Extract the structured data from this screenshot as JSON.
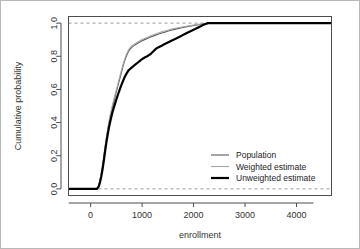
{
  "chart_data": {
    "type": "line",
    "title": "",
    "xlabel": "enrollment",
    "ylabel": "Cumulative probability",
    "xlim": [
      -430,
      4680
    ],
    "ylim": [
      -0.04,
      1.04
    ],
    "xticks": [
      0,
      1000,
      2000,
      3000,
      4000
    ],
    "xtick_labels": [
      "0",
      "1000",
      "2000",
      "3000",
      "4000"
    ],
    "yticks": [
      0.0,
      0.2,
      0.4,
      0.6,
      0.8,
      1.0
    ],
    "ytick_labels": [
      "0.0",
      "0.2",
      "0.4",
      "0.6",
      "0.8",
      "1.0"
    ],
    "grid": false,
    "reference_lines": [
      {
        "orientation": "horizontal",
        "value": 0.0,
        "style": "dashed",
        "color": "#999999"
      },
      {
        "orientation": "horizontal",
        "value": 1.0,
        "style": "dashed",
        "color": "#999999"
      }
    ],
    "legend": {
      "position": "lower-right",
      "entries": [
        {
          "label": "Population",
          "color": "#5a5a5a",
          "width": 1.1
        },
        {
          "label": "Weighted estimate",
          "color": "#a6a6a6",
          "width": 1.1
        },
        {
          "label": "Unweighted estimate",
          "color": "#000000",
          "width": 2.2
        }
      ]
    },
    "series": [
      {
        "name": "Population",
        "color": "#5a5a5a",
        "width": 1.1,
        "points": [
          [
            -430,
            0.0
          ],
          [
            60,
            0.0
          ],
          [
            120,
            0.0
          ],
          [
            150,
            0.015
          ],
          [
            175,
            0.04
          ],
          [
            200,
            0.075
          ],
          [
            225,
            0.12
          ],
          [
            250,
            0.175
          ],
          [
            275,
            0.235
          ],
          [
            300,
            0.29
          ],
          [
            325,
            0.34
          ],
          [
            350,
            0.385
          ],
          [
            375,
            0.425
          ],
          [
            400,
            0.46
          ],
          [
            425,
            0.495
          ],
          [
            450,
            0.525
          ],
          [
            475,
            0.555
          ],
          [
            500,
            0.585
          ],
          [
            525,
            0.615
          ],
          [
            550,
            0.645
          ],
          [
            575,
            0.675
          ],
          [
            600,
            0.705
          ],
          [
            625,
            0.735
          ],
          [
            650,
            0.762
          ],
          [
            675,
            0.785
          ],
          [
            700,
            0.805
          ],
          [
            725,
            0.822
          ],
          [
            750,
            0.836
          ],
          [
            780,
            0.848
          ],
          [
            810,
            0.857
          ],
          [
            850,
            0.866
          ],
          [
            900,
            0.876
          ],
          [
            950,
            0.885
          ],
          [
            1000,
            0.894
          ],
          [
            1060,
            0.902
          ],
          [
            1120,
            0.91
          ],
          [
            1180,
            0.918
          ],
          [
            1250,
            0.926
          ],
          [
            1320,
            0.934
          ],
          [
            1400,
            0.942
          ],
          [
            1480,
            0.95
          ],
          [
            1560,
            0.957
          ],
          [
            1650,
            0.964
          ],
          [
            1750,
            0.971
          ],
          [
            1850,
            0.977
          ],
          [
            1950,
            0.983
          ],
          [
            2050,
            0.988
          ],
          [
            2150,
            0.993
          ],
          [
            2250,
            0.997
          ],
          [
            2350,
            0.999
          ],
          [
            2500,
            1.0
          ],
          [
            3000,
            1.0
          ],
          [
            4000,
            1.0
          ],
          [
            4680,
            1.0
          ]
        ]
      },
      {
        "name": "Weighted estimate",
        "color": "#a6a6a6",
        "width": 1.1,
        "points": [
          [
            -430,
            0.0
          ],
          [
            60,
            0.0
          ],
          [
            120,
            0.0
          ],
          [
            150,
            0.018
          ],
          [
            175,
            0.045
          ],
          [
            200,
            0.082
          ],
          [
            225,
            0.13
          ],
          [
            250,
            0.185
          ],
          [
            275,
            0.245
          ],
          [
            300,
            0.3
          ],
          [
            325,
            0.35
          ],
          [
            350,
            0.398
          ],
          [
            375,
            0.438
          ],
          [
            400,
            0.474
          ],
          [
            425,
            0.508
          ],
          [
            450,
            0.538
          ],
          [
            475,
            0.568
          ],
          [
            500,
            0.598
          ],
          [
            525,
            0.628
          ],
          [
            550,
            0.658
          ],
          [
            575,
            0.688
          ],
          [
            600,
            0.718
          ],
          [
            625,
            0.746
          ],
          [
            650,
            0.772
          ],
          [
            675,
            0.795
          ],
          [
            700,
            0.815
          ],
          [
            725,
            0.831
          ],
          [
            750,
            0.845
          ],
          [
            780,
            0.856
          ],
          [
            810,
            0.864
          ],
          [
            850,
            0.873
          ],
          [
            900,
            0.883
          ],
          [
            950,
            0.892
          ],
          [
            1000,
            0.901
          ],
          [
            1060,
            0.909
          ],
          [
            1120,
            0.917
          ],
          [
            1180,
            0.925
          ],
          [
            1250,
            0.933
          ],
          [
            1320,
            0.941
          ],
          [
            1400,
            0.949
          ],
          [
            1480,
            0.956
          ],
          [
            1560,
            0.963
          ],
          [
            1650,
            0.969
          ],
          [
            1750,
            0.975
          ],
          [
            1850,
            0.981
          ],
          [
            1950,
            0.986
          ],
          [
            2050,
            0.991
          ],
          [
            2150,
            0.995
          ],
          [
            2250,
            0.998
          ],
          [
            2350,
            1.0
          ],
          [
            2500,
            1.0
          ],
          [
            3000,
            1.0
          ],
          [
            4000,
            1.0
          ],
          [
            4680,
            1.0
          ]
        ]
      },
      {
        "name": "Unweighted estimate",
        "color": "#000000",
        "width": 2.2,
        "points": [
          [
            -430,
            0.0
          ],
          [
            60,
            0.0
          ],
          [
            125,
            0.0
          ],
          [
            155,
            0.013
          ],
          [
            180,
            0.038
          ],
          [
            205,
            0.072
          ],
          [
            230,
            0.115
          ],
          [
            255,
            0.168
          ],
          [
            280,
            0.225
          ],
          [
            305,
            0.278
          ],
          [
            330,
            0.325
          ],
          [
            355,
            0.368
          ],
          [
            380,
            0.405
          ],
          [
            405,
            0.438
          ],
          [
            430,
            0.468
          ],
          [
            455,
            0.495
          ],
          [
            480,
            0.52
          ],
          [
            505,
            0.545
          ],
          [
            530,
            0.568
          ],
          [
            555,
            0.59
          ],
          [
            580,
            0.612
          ],
          [
            605,
            0.632
          ],
          [
            630,
            0.652
          ],
          [
            655,
            0.67
          ],
          [
            680,
            0.686
          ],
          [
            705,
            0.7
          ],
          [
            730,
            0.712
          ],
          [
            760,
            0.722
          ],
          [
            790,
            0.73
          ],
          [
            820,
            0.738
          ],
          [
            860,
            0.748
          ],
          [
            900,
            0.758
          ],
          [
            940,
            0.768
          ],
          [
            980,
            0.778
          ],
          [
            1020,
            0.787
          ],
          [
            1060,
            0.794
          ],
          [
            1100,
            0.8
          ],
          [
            1140,
            0.808
          ],
          [
            1180,
            0.818
          ],
          [
            1220,
            0.83
          ],
          [
            1260,
            0.843
          ],
          [
            1300,
            0.852
          ],
          [
            1340,
            0.858
          ],
          [
            1380,
            0.864
          ],
          [
            1430,
            0.872
          ],
          [
            1480,
            0.88
          ],
          [
            1530,
            0.888
          ],
          [
            1580,
            0.895
          ],
          [
            1630,
            0.902
          ],
          [
            1680,
            0.91
          ],
          [
            1730,
            0.918
          ],
          [
            1780,
            0.926
          ],
          [
            1830,
            0.934
          ],
          [
            1880,
            0.942
          ],
          [
            1930,
            0.95
          ],
          [
            1980,
            0.957
          ],
          [
            2030,
            0.964
          ],
          [
            2080,
            0.972
          ],
          [
            2130,
            0.98
          ],
          [
            2180,
            0.988
          ],
          [
            2230,
            0.995
          ],
          [
            2280,
            1.0
          ],
          [
            2400,
            1.0
          ],
          [
            3000,
            1.0
          ],
          [
            4000,
            1.0
          ],
          [
            4680,
            1.0
          ]
        ]
      }
    ]
  }
}
